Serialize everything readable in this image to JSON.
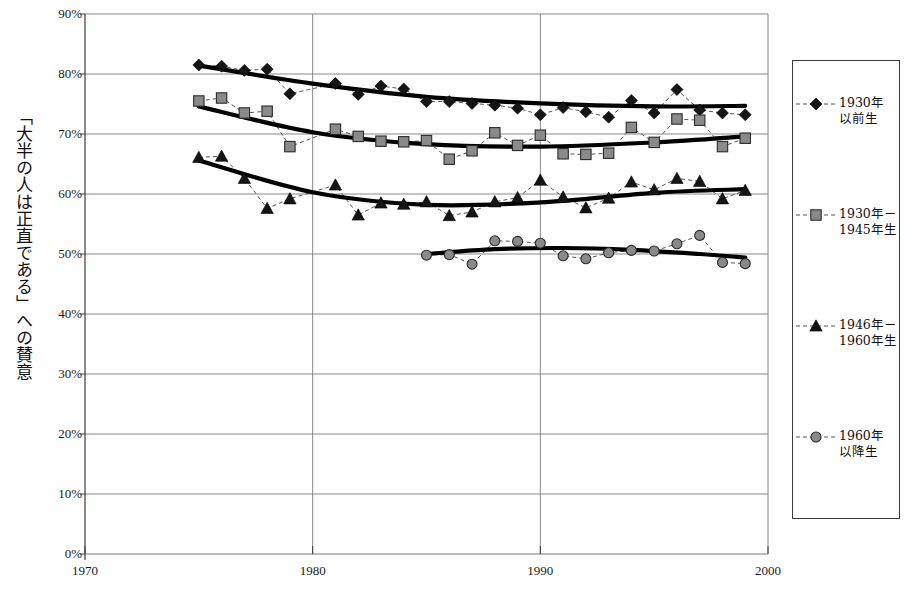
{
  "chart_data": {
    "type": "line",
    "title": "",
    "subtitle": "",
    "xlabel": "",
    "ylabel": "「大半の人は正直である」への賛意",
    "xlim": [
      1970,
      2000
    ],
    "ylim": [
      0,
      0.9
    ],
    "ytick_labels": [
      "0%",
      "10%",
      "20%",
      "30%",
      "40%",
      "50%",
      "60%",
      "70%",
      "80%",
      "90%"
    ],
    "ytick_values": [
      0,
      10,
      20,
      30,
      40,
      50,
      60,
      70,
      80,
      90
    ],
    "xtick_labels": [
      "1970",
      "1980",
      "1990",
      "2000"
    ],
    "xtick_values": [
      1970,
      1980,
      1990,
      2000
    ],
    "grid": "horizontal",
    "legend_position": "right-outside",
    "marker_colors": {
      "diamond": "#1a1a1a",
      "square": "#7d7d7d",
      "triangle": "#1a1a1a",
      "circle": "#7d7d7d"
    },
    "trend_line_color": "#000000",
    "data_line_style": "dashed",
    "series": [
      {
        "name": "1930年\n以前生",
        "marker": "diamond",
        "x": [
          1975,
          1976,
          1977,
          1978,
          1979,
          1981,
          1982,
          1983,
          1984,
          1985,
          1986,
          1987,
          1988,
          1989,
          1990,
          1991,
          1992,
          1993,
          1994,
          1995,
          1996,
          1997,
          1998,
          1999
        ],
        "values": [
          81.5,
          81.3,
          80.6,
          80.8,
          76.7,
          78.4,
          76.6,
          78.0,
          77.5,
          75.4,
          75.4,
          75.1,
          74.8,
          74.3,
          73.2,
          74.4,
          73.7,
          72.8,
          75.6,
          73.5,
          77.4,
          74.0,
          73.5,
          73.2
        ],
        "trend": [
          [
            1975,
            81.4
          ],
          [
            1980,
            78.4
          ],
          [
            1985,
            76.2
          ],
          [
            1990,
            75.1
          ],
          [
            1995,
            74.6
          ],
          [
            1999,
            74.7
          ]
        ]
      },
      {
        "name": "1930年－\n1945年生",
        "marker": "square",
        "x": [
          1975,
          1976,
          1977,
          1978,
          1979,
          1981,
          1982,
          1983,
          1984,
          1985,
          1986,
          1987,
          1988,
          1989,
          1990,
          1991,
          1992,
          1993,
          1994,
          1995,
          1996,
          1997,
          1998,
          1999
        ],
        "values": [
          75.5,
          76.0,
          73.5,
          73.8,
          67.9,
          70.8,
          69.6,
          68.8,
          68.7,
          68.9,
          65.8,
          67.2,
          70.2,
          68.1,
          69.8,
          66.7,
          66.6,
          66.8,
          71.1,
          68.6,
          72.5,
          72.3,
          67.9,
          69.3
        ],
        "trend": [
          [
            1975,
            74.6
          ],
          [
            1980,
            70.3
          ],
          [
            1985,
            68.3
          ],
          [
            1990,
            67.9
          ],
          [
            1995,
            68.6
          ],
          [
            1999,
            69.6
          ]
        ]
      },
      {
        "name": "1946年－\n1960年生",
        "marker": "triangle",
        "x": [
          1975,
          1976,
          1977,
          1978,
          1979,
          1981,
          1982,
          1983,
          1984,
          1985,
          1986,
          1987,
          1988,
          1989,
          1990,
          1991,
          1992,
          1993,
          1994,
          1995,
          1996,
          1997,
          1998,
          1999
        ],
        "values": [
          66.1,
          66.3,
          62.6,
          57.6,
          59.2,
          61.5,
          56.5,
          58.5,
          58.3,
          58.7,
          56.4,
          57.0,
          58.7,
          59.4,
          62.3,
          59.5,
          57.7,
          59.3,
          62.0,
          60.7,
          62.6,
          62.1,
          59.2,
          60.6
        ],
        "trend": [
          [
            1975,
            65.6
          ],
          [
            1980,
            60.3
          ],
          [
            1985,
            58.2
          ],
          [
            1990,
            58.6
          ],
          [
            1995,
            60.2
          ],
          [
            1999,
            60.8
          ]
        ]
      },
      {
        "name": "1960年\n以降生",
        "marker": "circle",
        "x": [
          1985,
          1986,
          1987,
          1988,
          1989,
          1990,
          1991,
          1992,
          1993,
          1994,
          1995,
          1996,
          1997,
          1998,
          1999
        ],
        "values": [
          49.8,
          49.9,
          48.3,
          52.2,
          52.1,
          51.8,
          49.7,
          49.2,
          50.2,
          50.6,
          50.5,
          51.7,
          53.1,
          48.6,
          48.4
        ],
        "trend": [
          [
            1985,
            50.0
          ],
          [
            1988,
            50.8
          ],
          [
            1991,
            51.0
          ],
          [
            1994,
            50.7
          ],
          [
            1997,
            50.0
          ],
          [
            1999,
            49.4
          ]
        ]
      }
    ]
  },
  "legend": {
    "entries": [
      {
        "label": "1930年\n以前生",
        "marker": "diamond"
      },
      {
        "label": "1930年－\n1945年生",
        "marker": "square"
      },
      {
        "label": "1946年－\n1960年生",
        "marker": "triangle"
      },
      {
        "label": "1960年\n以降生",
        "marker": "circle"
      }
    ]
  },
  "axes": {
    "y_title": "「大半の人は正直である」への賛意"
  }
}
